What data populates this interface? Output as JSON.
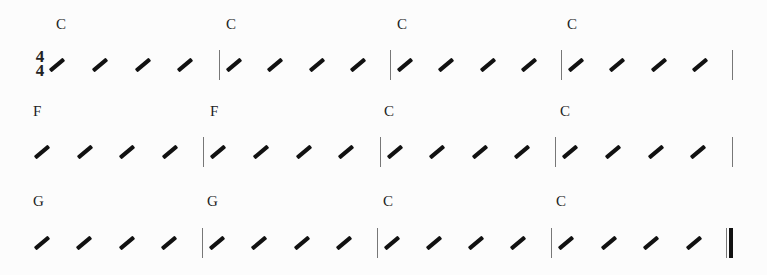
{
  "time_signature": {
    "numerator": "4",
    "denominator": "4"
  },
  "systems": [
    {
      "measures": [
        {
          "chord": "C",
          "beats": 4
        },
        {
          "chord": "C",
          "beats": 4
        },
        {
          "chord": "C",
          "beats": 4
        },
        {
          "chord": "C",
          "beats": 4
        }
      ]
    },
    {
      "measures": [
        {
          "chord": "F",
          "beats": 4
        },
        {
          "chord": "F",
          "beats": 4
        },
        {
          "chord": "C",
          "beats": 4
        },
        {
          "chord": "C",
          "beats": 4
        }
      ]
    },
    {
      "measures": [
        {
          "chord": "G",
          "beats": 4
        },
        {
          "chord": "G",
          "beats": 4
        },
        {
          "chord": "C",
          "beats": 4
        },
        {
          "chord": "C",
          "beats": 4
        }
      ]
    }
  ],
  "final_barline": "final-double-bar"
}
